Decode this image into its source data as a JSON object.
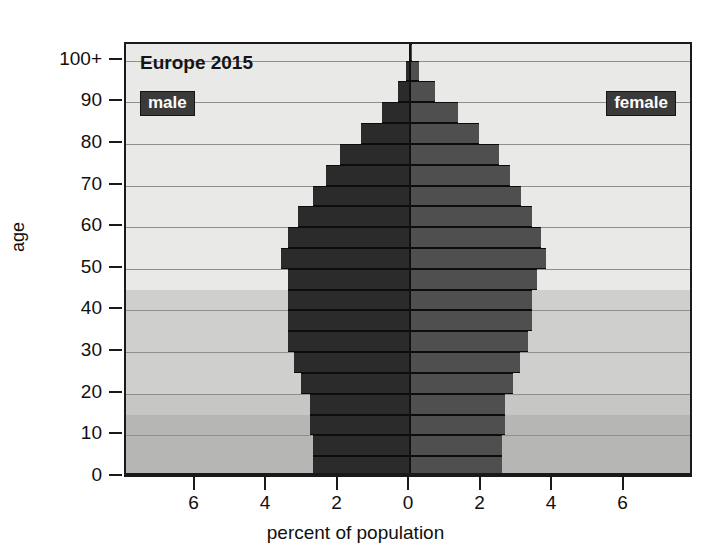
{
  "chart_data": {
    "type": "bar",
    "subtype": "population-pyramid",
    "title": "Europe 2015",
    "xlabel": "percent of population",
    "ylabel": "age",
    "xlim": [
      -7.4,
      7.4
    ],
    "ylim": [
      0,
      104
    ],
    "xtick_values": [
      6,
      4,
      2,
      0,
      2,
      4,
      6
    ],
    "xtick_labels": [
      "6",
      "4",
      "2",
      "0",
      "2",
      "4",
      "6"
    ],
    "ytick_values": [
      0,
      10,
      20,
      30,
      40,
      50,
      60,
      70,
      80,
      90,
      100
    ],
    "ytick_labels": [
      "0",
      "10",
      "20",
      "30",
      "40",
      "50",
      "60",
      "70",
      "80",
      "90",
      "100+"
    ],
    "grid": true,
    "legend_position": "inside-top",
    "series": [
      {
        "name": "male",
        "side": "left",
        "color": "#2b2b2b",
        "values": [
          2.72,
          2.72,
          2.81,
          2.81,
          3.04,
          3.25,
          3.4,
          3.42,
          3.42,
          3.42,
          3.61,
          3.4,
          3.12,
          2.72,
          2.35,
          1.95,
          1.36,
          0.79,
          0.33,
          0.1,
          0.02
        ]
      },
      {
        "name": "female",
        "side": "right",
        "color": "#4f4f4f",
        "values": [
          2.58,
          2.58,
          2.66,
          2.66,
          2.88,
          3.08,
          3.3,
          3.42,
          3.42,
          3.54,
          3.81,
          3.66,
          3.4,
          3.1,
          2.8,
          2.5,
          1.93,
          1.35,
          0.7,
          0.25,
          0.06
        ]
      }
    ],
    "age_groups": [
      {
        "label": "0-4",
        "low": 0,
        "high": 5
      },
      {
        "label": "5-9",
        "low": 5,
        "high": 10
      },
      {
        "label": "10-14",
        "low": 10,
        "high": 15
      },
      {
        "label": "15-19",
        "low": 15,
        "high": 20
      },
      {
        "label": "20-24",
        "low": 20,
        "high": 25
      },
      {
        "label": "25-29",
        "low": 25,
        "high": 30
      },
      {
        "label": "30-34",
        "low": 30,
        "high": 35
      },
      {
        "label": "35-39",
        "low": 35,
        "high": 40
      },
      {
        "label": "40-44",
        "low": 40,
        "high": 45
      },
      {
        "label": "45-49",
        "low": 45,
        "high": 50
      },
      {
        "label": "50-54",
        "low": 50,
        "high": 55
      },
      {
        "label": "55-59",
        "low": 55,
        "high": 60
      },
      {
        "label": "60-64",
        "low": 60,
        "high": 65
      },
      {
        "label": "65-69",
        "low": 65,
        "high": 70
      },
      {
        "label": "70-74",
        "low": 70,
        "high": 75
      },
      {
        "label": "75-79",
        "low": 75,
        "high": 80
      },
      {
        "label": "80-84",
        "low": 80,
        "high": 85
      },
      {
        "label": "85-89",
        "low": 85,
        "high": 90
      },
      {
        "label": "90-94",
        "low": 90,
        "high": 95
      },
      {
        "label": "95-99",
        "low": 95,
        "high": 100
      },
      {
        "label": "100+",
        "low": 100,
        "high": 104
      }
    ],
    "shaded_bands": [
      {
        "low": 0,
        "high": 15,
        "shade": "#b6b6b4",
        "note": "youth band"
      },
      {
        "low": 15,
        "high": 20,
        "shade": "#c6c6c4",
        "note": "transition band"
      },
      {
        "low": 20,
        "high": 45,
        "shade": "#cfcfcd",
        "note": "working-age lower band"
      },
      {
        "low": 45,
        "high": 104,
        "shade": "#e9e9e7",
        "note": "older band"
      }
    ]
  },
  "legend": {
    "male_label": "male",
    "female_label": "female"
  },
  "colors": {
    "male_bar": "#2b2b2b",
    "female_bar": "#4f4f4f",
    "badge_bg": "#3a3a3a",
    "badge_text": "#fdfdfd",
    "plot_bg": "#e9e9e7",
    "frame": "#1a1a1a",
    "gridline": "#8f8f8f"
  }
}
